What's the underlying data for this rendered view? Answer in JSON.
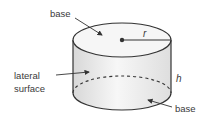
{
  "figure": {
    "type": "cylinder",
    "labels": {
      "top_base": "base",
      "bottom_base": "base",
      "lateral_line1": "lateral",
      "lateral_line2": "surface",
      "radius": "r",
      "height": "h"
    },
    "colors": {
      "outline": "#333333",
      "fill_light": "#f4f4f4",
      "fill_shade": "#dcdcdc",
      "text": "#3a3a3a"
    }
  }
}
